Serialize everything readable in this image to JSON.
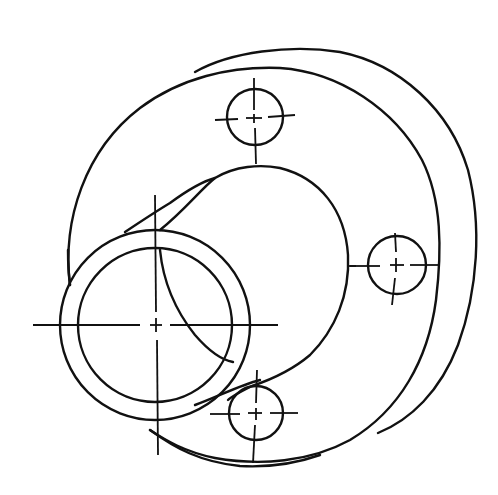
{
  "drawing": {
    "title": "Flanged hub sketch",
    "description": "Hand-drawn oblique sketch of a circular flange with a cylindrical hub, a tubular boss and three bolt holes with centerlines",
    "stroke_color": "#111111",
    "background": "#ffffff",
    "flange": {
      "front_face": {
        "cx": 255,
        "cy": 264,
        "rx": 188,
        "ry": 198
      },
      "back_rim": {
        "cx": 282,
        "cy": 250,
        "rx": 194,
        "ry": 206
      }
    },
    "hub": {
      "cx": 257,
      "cy": 258,
      "r": 92
    },
    "boss": {
      "cx": 155,
      "cy": 325,
      "outer_r": 95,
      "inner_r": 77
    },
    "bolt_holes": [
      {
        "label": "bolt-hole-top",
        "cx": 255,
        "cy": 117,
        "r": 28
      },
      {
        "label": "bolt-hole-right",
        "cx": 397,
        "cy": 265,
        "r": 29
      },
      {
        "label": "bolt-hole-bottom",
        "cx": 256,
        "cy": 413,
        "r": 27
      }
    ]
  }
}
